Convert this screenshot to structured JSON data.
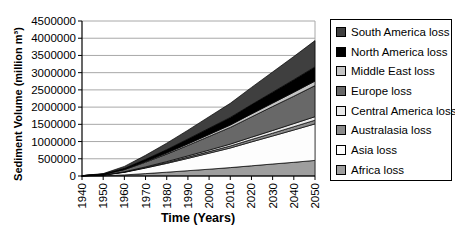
{
  "chart_data": {
    "type": "area",
    "stacked": true,
    "title": "",
    "xlabel": "Time (Years)",
    "ylabel": "Sediment Volume (million m³)",
    "xlim": [
      1940,
      2050
    ],
    "ylim": [
      0,
      4500000
    ],
    "grid": true,
    "legend_position": "right",
    "x": [
      1940,
      1950,
      1960,
      1970,
      1980,
      1990,
      2000,
      2010,
      2020,
      2030,
      2040,
      2050
    ],
    "x_tick_labels": [
      "1940",
      "1950",
      "1960",
      "1970",
      "1980",
      "1990",
      "2000",
      "2010",
      "2020",
      "2030",
      "2040",
      "2050"
    ],
    "y_ticks": [
      0,
      500000,
      1000000,
      1500000,
      2000000,
      2500000,
      3000000,
      3500000,
      4000000,
      4500000
    ],
    "y_tick_labels": [
      "0",
      "500000",
      "1000000",
      "1500000",
      "2000000",
      "2500000",
      "3000000",
      "3500000",
      "4000000",
      "4500000"
    ],
    "colors": {
      "grid": "#a8a8a8",
      "axis": "#000000",
      "outline": "#000000",
      "plot_background": "#ffffff",
      "legend_border": "#000000"
    },
    "series": [
      {
        "name": "Africa loss",
        "color": "#9e9e9e",
        "values": [
          2000,
          8000,
          32000,
          69000,
          109000,
          153000,
          198000,
          243000,
          296000,
          347000,
          399000,
          452000
        ]
      },
      {
        "name": "Asia loss",
        "color": "#fdfdfd",
        "values": [
          3000,
          19000,
          76000,
          162000,
          257000,
          359000,
          464000,
          570000,
          694000,
          815000,
          937000,
          1061000
        ]
      },
      {
        "name": "Australasia loss",
        "color": "#8b8b8b",
        "values": [
          500,
          2000,
          8000,
          16000,
          26000,
          36000,
          46000,
          57000,
          69000,
          81000,
          94000,
          106000
        ]
      },
      {
        "name": "Central America loss",
        "color": "#e9e9e9",
        "values": [
          500,
          2000,
          7000,
          16000,
          25000,
          35000,
          45000,
          55000,
          67000,
          79000,
          90000,
          102000
        ]
      },
      {
        "name": "Europe loss",
        "color": "#686868",
        "values": [
          2000,
          16000,
          64000,
          138000,
          219000,
          306000,
          396000,
          485000,
          591000,
          695000,
          798000,
          904000
        ]
      },
      {
        "name": "Middle East loss",
        "color": "#c4c4c4",
        "values": [
          500,
          2000,
          9000,
          20000,
          31000,
          44000,
          57000,
          70000,
          85000,
          100000,
          115000,
          130000
        ]
      },
      {
        "name": "North America loss",
        "color": "#000000",
        "values": [
          1000,
          7000,
          29000,
          63000,
          100000,
          140000,
          181000,
          222000,
          270000,
          317000,
          364000,
          413000
        ]
      },
      {
        "name": "South America loss",
        "color": "#3f3f3f",
        "values": [
          1500,
          14000,
          54000,
          116000,
          184000,
          258000,
          334000,
          409000,
          499000,
          586000,
          673000,
          762000
        ]
      }
    ]
  }
}
